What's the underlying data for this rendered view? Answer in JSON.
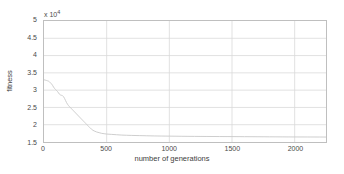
{
  "chart_data": {
    "type": "line",
    "title": "",
    "xlabel": "number of generations",
    "ylabel": "fitness",
    "y_exponent_label": "x 10",
    "y_exponent_power": "4",
    "y_scale_factor": 10000,
    "xlim": [
      0,
      2250
    ],
    "ylim": [
      15000,
      50000
    ],
    "xticks": [
      0,
      500,
      1000,
      1500,
      2000
    ],
    "xtick_labels": [
      "0",
      "500",
      "1000",
      "1500",
      "2000"
    ],
    "yticks": [
      15000,
      20000,
      25000,
      30000,
      35000,
      40000,
      45000,
      50000
    ],
    "ytick_labels": [
      "1.5",
      "2",
      "2.5",
      "3",
      "3.5",
      "4",
      "4.5",
      "5"
    ],
    "grid": true,
    "legend": null,
    "line_color": "#c8c8c8",
    "grid_color": "#d9d9d9",
    "axis_color": "#bfbfbf",
    "series": [
      {
        "name": "best fitness",
        "x": [
          0,
          10,
          20,
          28,
          36,
          44,
          52,
          60,
          68,
          76,
          84,
          92,
          100,
          108,
          116,
          124,
          132,
          140,
          148,
          156,
          164,
          172,
          180,
          188,
          196,
          204,
          212,
          220,
          228,
          236,
          244,
          252,
          260,
          268,
          276,
          284,
          292,
          300,
          308,
          316,
          324,
          332,
          340,
          348,
          356,
          364,
          372,
          380,
          390,
          400,
          420,
          440,
          460,
          480,
          500,
          540,
          580,
          620,
          660,
          700,
          760,
          820,
          880,
          940,
          1000,
          1100,
          1200,
          1300,
          1400,
          1500,
          1600,
          1700,
          1800,
          1900,
          2000,
          2100,
          2200,
          2250
        ],
        "y": [
          33000,
          32900,
          32800,
          32700,
          32600,
          32400,
          32100,
          31800,
          31400,
          30900,
          30500,
          30200,
          29900,
          29600,
          29200,
          28800,
          28600,
          28500,
          28400,
          28100,
          27600,
          27000,
          26400,
          25900,
          25500,
          25200,
          24900,
          24600,
          24300,
          24000,
          23700,
          23400,
          23100,
          22800,
          22500,
          22200,
          21900,
          21600,
          21300,
          21000,
          20700,
          20400,
          20100,
          19800,
          19500,
          19200,
          18900,
          18700,
          18400,
          18200,
          17900,
          17700,
          17500,
          17400,
          17300,
          17200,
          17100,
          17000,
          16950,
          16900,
          16850,
          16800,
          16750,
          16720,
          16700,
          16650,
          16620,
          16600,
          16580,
          16560,
          16540,
          16520,
          16500,
          16480,
          16460,
          16450,
          16440,
          16430
        ]
      }
    ]
  }
}
